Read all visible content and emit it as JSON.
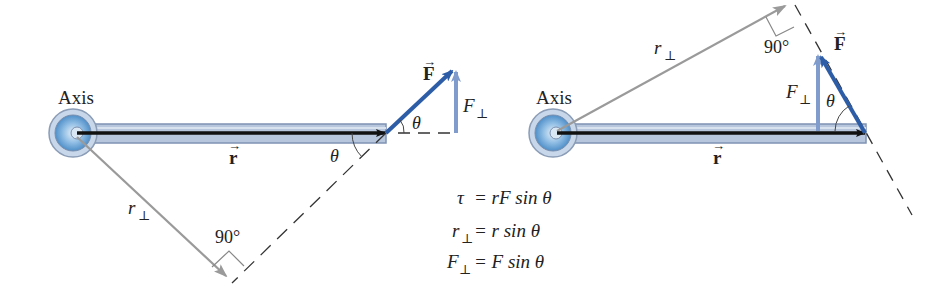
{
  "left_diagram": {
    "axis_label": "Axis",
    "r_label": "r",
    "r_perp_label": "r",
    "perp_sub": "⊥",
    "right_angle_label": "90°",
    "theta_label_force": "θ",
    "theta_label_line": "θ",
    "force_label": "F",
    "f_perp_label": "F"
  },
  "right_diagram": {
    "axis_label": "Axis",
    "r_label": "r",
    "r_perp_label": "r",
    "perp_sub": "⊥",
    "right_angle_label": "90°",
    "theta_label": "θ",
    "force_label": "F",
    "f_perp_label": "F"
  },
  "equations": [
    {
      "lhs": "τ",
      "lhs_sub": "",
      "rhs": "= rF sin θ"
    },
    {
      "lhs": "r",
      "lhs_sub": "⊥",
      "rhs": "= r sin θ"
    },
    {
      "lhs": "F",
      "lhs_sub": "⊥",
      "rhs": "= F sin θ"
    }
  ],
  "colors": {
    "bar_fill": "#b7c6dc",
    "bar_stroke": "#7f93b3",
    "force_blue": "#2e5da8",
    "f_perp_blue": "#7f9ccc",
    "r_perp_gray": "#9a9a9a",
    "hub_blue": "#6aa6d8"
  }
}
